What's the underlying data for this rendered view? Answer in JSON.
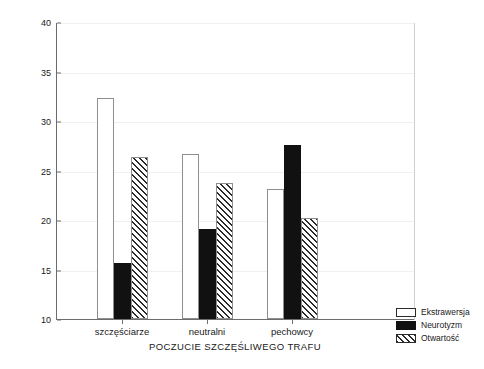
{
  "chart_data": {
    "type": "bar",
    "title": "",
    "subtitle": "",
    "xlabel": "POCZUCIE SZCZĘŚLIWEGO TRAFU",
    "ylabel": "ŚREDNIE WYNIKÓW",
    "categories": [
      "szczęściarze",
      "neutralni",
      "pechowcy"
    ],
    "series": [
      {
        "name": "Ekstrawersja",
        "values": [
          32.3,
          26.7,
          23.1
        ],
        "style": "white-outline"
      },
      {
        "name": "Neurotyzm",
        "values": [
          15.7,
          19.1,
          27.6
        ],
        "style": "solid-black"
      },
      {
        "name": "Otwartość",
        "values": [
          26.4,
          23.7,
          20.2
        ],
        "style": "diagonal-hatch"
      }
    ],
    "ylim": [
      10,
      40
    ],
    "yticks": [
      10,
      15,
      20,
      25,
      30,
      35,
      40
    ],
    "ytick_labels": [
      "10",
      "15",
      "20",
      "25",
      "30",
      "35",
      "40"
    ],
    "grid": "faint-horizontal",
    "legend_position": "bottom-right-outside"
  },
  "legend": {
    "entries": [
      {
        "label": "Ekstrawersja"
      },
      {
        "label": "Neurotyzm"
      },
      {
        "label": "Otwartość"
      }
    ]
  },
  "colors": {
    "axis": "#6d6d6d",
    "text": "#202020",
    "series_ekstrawersja": "#ffffff",
    "series_neurotyzm": "#111111",
    "series_otwartosc": "#2b2b2b",
    "gridline": "#f0f0f0",
    "background": "#ffffff"
  }
}
